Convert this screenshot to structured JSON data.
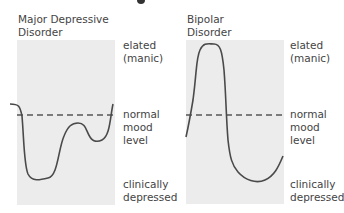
{
  "figure": {
    "panels": [
      {
        "id": "major-depressive",
        "title_line1": "Major Depressive",
        "title_line2": "Disorder",
        "labels": {
          "elated_line1": "elated",
          "elated_line2": "(manic)",
          "normal_line1": "normal",
          "normal_line2": "mood",
          "normal_line3": "level",
          "depressed_line1": "clinically",
          "depressed_line2": "depressed"
        }
      },
      {
        "id": "bipolar",
        "title_line1": "Bipolar",
        "title_line2": "Disorder",
        "labels": {
          "elated_line1": "elated",
          "elated_line2": "(manic)",
          "normal_line1": "normal",
          "normal_line2": "mood",
          "normal_line3": "level",
          "depressed_line1": "clinically",
          "depressed_line2": "depressed"
        }
      }
    ],
    "colors": {
      "panel_bg": "#ececec",
      "curve": "#4a4a4a",
      "dashed_line": "#555555",
      "text": "#444444"
    }
  }
}
